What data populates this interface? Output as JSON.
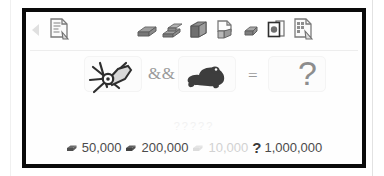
{
  "window": {
    "frame_color": "#0a0a0a",
    "background": "#fefefe"
  },
  "toolbar": {
    "scroll_left_icon": "triangle-left-icon",
    "items": [
      {
        "name": "document-tool-icon",
        "icon": "document-with-tool-icon",
        "x": 20
      },
      {
        "name": "ore-chunk-a-icon",
        "icon": "ore-chunk-icon",
        "x": 108
      },
      {
        "name": "ore-chunk-b-icon",
        "icon": "ore-chunk-stack-icon",
        "x": 134
      },
      {
        "name": "ore-block-icon",
        "icon": "ore-block-icon",
        "x": 160
      },
      {
        "name": "page-corner-icon",
        "icon": "page-fold-icon",
        "x": 186
      },
      {
        "name": "small-rock-icon",
        "icon": "small-rock-icon",
        "x": 212
      },
      {
        "name": "framed-gem-icon",
        "icon": "framed-document-icon",
        "x": 238
      },
      {
        "name": "blueprint-icon",
        "icon": "blueprint-tool-icon",
        "x": 264
      }
    ]
  },
  "formula": {
    "operand_a": {
      "name": "angle-grinder-sprite",
      "label": "angle-grinder"
    },
    "operator_1": "&&",
    "operand_b": {
      "name": "toad-sprite",
      "label": "toad"
    },
    "operator_2": "=",
    "result": "?"
  },
  "ghost_text": "?????",
  "costs": [
    {
      "icon": "ore-chunk-icon",
      "value": "50,000",
      "faded": false
    },
    {
      "icon": "ore-chunk-icon",
      "value": "200,000",
      "faded": false
    },
    {
      "icon": "ore-chunk-icon",
      "value": "10,000",
      "faded": true
    },
    {
      "icon": "question-icon",
      "value": "1,000,000",
      "faded": false
    }
  ],
  "colors": {
    "frame": "#0a0a0a",
    "text": "#4b4b4b",
    "muted": "#9a9a9a",
    "faint": "#d2d2d2",
    "ghost": "#f2f2f2",
    "sprite_dark": "#3d3d3d",
    "icon_gray": "#8a8a8a"
  }
}
